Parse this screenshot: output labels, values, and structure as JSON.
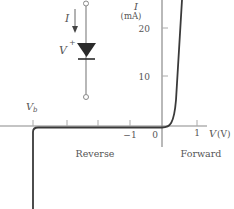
{
  "figure": {
    "type": "diode I-V characteristic",
    "circuit": {
      "current_label": "I",
      "voltage_label": "V",
      "voltage_sign": "+"
    },
    "axes": {
      "y_label": "I",
      "y_unit": "(mA)",
      "x_label": "V",
      "x_unit": "(V)",
      "y_ticks": [
        {
          "label": "20",
          "value": 20
        },
        {
          "label": "10",
          "value": 10
        }
      ],
      "x_ticks": [
        {
          "label": "−1",
          "value": -1
        },
        {
          "label": "0",
          "value": 0
        },
        {
          "label": "1",
          "value": 1
        }
      ],
      "breakdown_label": "V",
      "breakdown_subscript": "b"
    },
    "regions": {
      "reverse": "Reverse",
      "forward": "Forward"
    }
  },
  "colors": {
    "axis": "#8a8a8a",
    "curve": "#3a3a3a",
    "text": "#555555",
    "diode": "#2a2a2a"
  }
}
